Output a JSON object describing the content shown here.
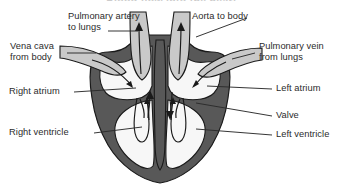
{
  "figure": {
    "title": "Blood flow into the heart",
    "type": "anatomical-diagram",
    "background_color": "#ffffff"
  },
  "colors": {
    "muscle_dark": "#585858",
    "vessel_light": "#c9c9c9",
    "chamber_fill": "#f7f7f7",
    "outline": "#1a1a1a",
    "label_text": "#2b2b2b",
    "leader_line": "#2b2b2b"
  },
  "labels": {
    "pulmonary_artery": {
      "line1": "Pulmonary artery",
      "line2": "to lungs"
    },
    "aorta": {
      "line1": "Aorta to body"
    },
    "vena_cava": {
      "line1": "Vena cava",
      "line2": "from body"
    },
    "pulmonary_vein": {
      "line1": "Pulmonary vein",
      "line2": "from lungs"
    },
    "right_atrium": {
      "line1": "Right atrium"
    },
    "left_atrium": {
      "line1": "Left atrium"
    },
    "right_ventricle": {
      "line1": "Right ventricle"
    },
    "left_ventricle": {
      "line1": "Left ventricle"
    },
    "valve": {
      "line1": "Valve"
    }
  }
}
